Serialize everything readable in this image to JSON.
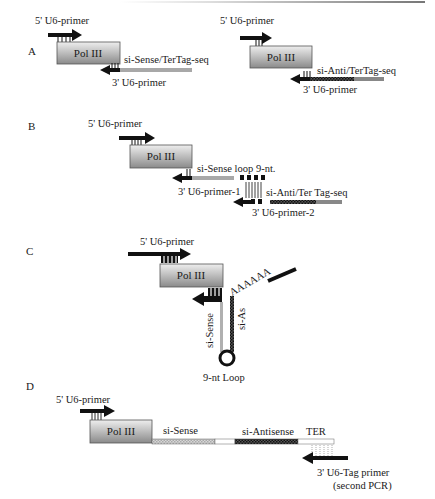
{
  "figure": {
    "panels": {
      "A": {
        "letter": "A",
        "left": {
          "forward_primer": "5' U6-primer",
          "promoter": "Pol III",
          "insert": "si-Sense/TerTag-seq",
          "reverse_primer": "3' U6-primer"
        },
        "right": {
          "forward_primer": "5' U6-primer",
          "promoter": "Pol III",
          "insert": "si-Anti/TerTag-seq",
          "reverse_primer": "3' U6-primer"
        }
      },
      "B": {
        "letter": "B",
        "forward_primer": "5' U6-primer",
        "promoter": "Pol III",
        "insert_1": "si-Sense loop 9-nt.",
        "reverse_primer_1": "3' U6-primer-1",
        "insert_2": "si-Anti/Ter Tag-seq",
        "reverse_primer_2": "3' U6-primer-2"
      },
      "C": {
        "letter": "C",
        "forward_primer": "5' U6-primer",
        "promoter": "Pol III",
        "sense_strand": "si-Sense",
        "antisense_strand": "si-As",
        "poly_a": "AAAAAA",
        "loop": "9-nt Loop"
      },
      "D": {
        "letter": "D",
        "forward_primer": "5' U6-primer",
        "promoter": "Pol III",
        "sense": "si-Sense",
        "antisense": "si-Antisense",
        "terminator": "TER",
        "reverse_primer": "3' U6-Tag primer",
        "reverse_primer_note": "(second PCR)"
      }
    },
    "colors": {
      "arrow": "#111111",
      "box_top": "#ececec",
      "box_bottom": "#8a8a8a",
      "sense_strand": "#b5b5b5",
      "antisense_strand": "#3a3a3a"
    }
  }
}
